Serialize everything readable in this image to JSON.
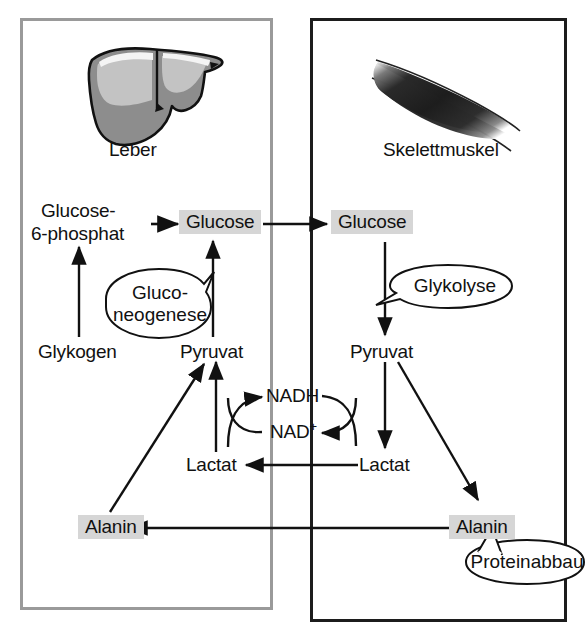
{
  "figure": {
    "type": "diagram",
    "language": "de"
  },
  "panels": {
    "left": {
      "name": "liver-panel",
      "organ_label": "Leber",
      "organ_icon": "liver-icon",
      "border_color": "#9a9a9a"
    },
    "right": {
      "name": "muscle-panel",
      "organ_label": "Skelettmuskel",
      "organ_icon": "skeletal-muscle-icon",
      "border_color": "#1c1c1c"
    }
  },
  "nodes": {
    "glucose6phosphat": {
      "line1": "Glucose-",
      "line2": "6-phosphat",
      "highlighted": false
    },
    "glucose_liver": {
      "label": "Glucose",
      "highlighted": true
    },
    "glucose_muscle": {
      "label": "Glucose",
      "highlighted": true
    },
    "glykogen": {
      "label": "Glykogen",
      "highlighted": false
    },
    "pyruvat_liver": {
      "label": "Pyruvat",
      "highlighted": false
    },
    "pyruvat_muscle": {
      "label": "Pyruvat",
      "highlighted": false
    },
    "lactat_liver": {
      "label": "Lactat",
      "highlighted": false
    },
    "lactat_muscle": {
      "label": "Lactat",
      "highlighted": false
    },
    "alanin_liver": {
      "label": "Alanin",
      "highlighted": true
    },
    "alanin_muscle": {
      "label": "Alanin",
      "highlighted": true
    },
    "nadh": {
      "label": "NADH",
      "highlighted": false
    },
    "nad_plus": {
      "label": "NAD",
      "superscript": "+",
      "highlighted": false
    }
  },
  "bubbles": {
    "gluconeogenese": {
      "line1": "Gluco-",
      "line2": "neogenese"
    },
    "glykolyse": {
      "label": "Glykolyse"
    },
    "proteinabbau": {
      "label": "Proteinabbau"
    }
  },
  "colors": {
    "highlight_fill": "#d6d6d6",
    "stroke": "#111111",
    "liver_fill": "#8d8d8d",
    "liver_light": "#c3c3c3",
    "muscle_fill": "#242424",
    "left_border": "#9a9a9a",
    "right_border": "#1c1c1c",
    "background": "#ffffff"
  },
  "edges": [
    {
      "from": "glucose6phosphat",
      "to": "glucose_liver",
      "kind": "arrow"
    },
    {
      "from": "glucose_liver",
      "to": "glucose_muscle",
      "kind": "arrow"
    },
    {
      "from": "glykogen",
      "to": "glucose6phosphat",
      "kind": "arrow"
    },
    {
      "from": "pyruvat_liver",
      "to": "glucose_liver",
      "kind": "arrow"
    },
    {
      "from": "glucose_muscle",
      "to": "pyruvat_muscle",
      "kind": "arrow"
    },
    {
      "from": "pyruvat_muscle",
      "to": "lactat_muscle",
      "kind": "arrow"
    },
    {
      "from": "pyruvat_muscle",
      "to": "alanin_muscle",
      "kind": "arrow"
    },
    {
      "from": "lactat_muscle",
      "to": "lactat_liver",
      "kind": "arrow"
    },
    {
      "from": "lactat_liver",
      "to": "pyruvat_liver",
      "kind": "arrow"
    },
    {
      "from": "alanin_muscle",
      "to": "alanin_liver",
      "kind": "arrow"
    },
    {
      "from": "alanin_liver",
      "to": "pyruvat_liver",
      "kind": "arrow"
    },
    {
      "from": "lactat_liver",
      "to": "nadh",
      "kind": "curved-arrow"
    },
    {
      "from": "nad_plus",
      "to": "pyruvat_liver",
      "kind": "curved"
    },
    {
      "from": "pyruvat_muscle",
      "to": "nad_plus",
      "kind": "curved-arrow"
    },
    {
      "from": "nadh",
      "to": "lactat_muscle",
      "kind": "curved"
    }
  ]
}
